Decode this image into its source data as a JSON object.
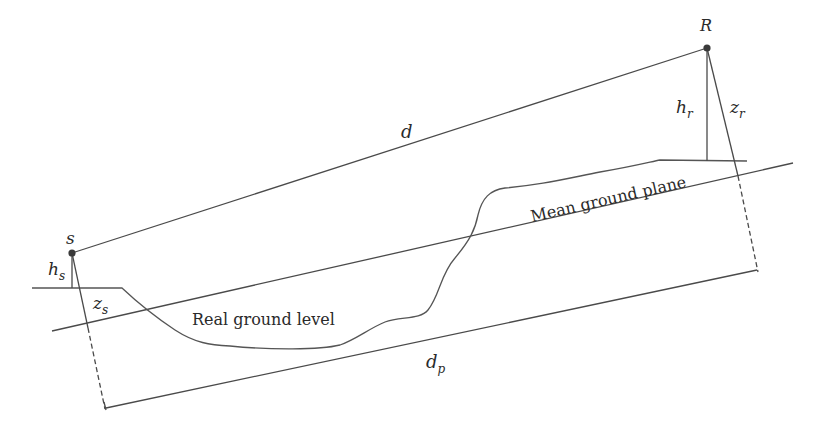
{
  "diagram": {
    "type": "propagation-geometry",
    "points": {
      "source": {
        "label": "s",
        "x": 72,
        "y": 253
      },
      "receiver": {
        "label": "R",
        "x": 707,
        "y": 48
      }
    },
    "labels": {
      "direct_distance": "d",
      "source_height": "h",
      "source_height_sub": "s",
      "receiver_height": "h",
      "receiver_height_sub": "r",
      "source_z": "z",
      "source_z_sub": "s",
      "receiver_z": "z",
      "receiver_z_sub": "r",
      "projected_distance": "d",
      "projected_distance_sub": "p",
      "mean_ground": "Mean ground plane",
      "real_ground": "Real ground level"
    },
    "colors": {
      "line": "#4a4a4a",
      "point": "#3a3a3a",
      "text": "#2a2a2a",
      "background": "#ffffff"
    }
  }
}
